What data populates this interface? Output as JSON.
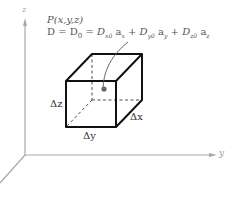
{
  "diagram": {
    "axes": {
      "z_label": "z",
      "y_label": "y",
      "x_label": ""
    },
    "point_label": "P(x,y,z)",
    "equation": {
      "lhs": "D",
      "eq1": "=",
      "d0": "D",
      "d0_sub": "0",
      "eq2": "=",
      "terms": [
        {
          "coef": "D",
          "coef_sub": "x0",
          "unit": "a",
          "unit_sub": "x"
        },
        {
          "coef": "D",
          "coef_sub": "y0",
          "unit": "a",
          "unit_sub": "y"
        },
        {
          "coef": "D",
          "coef_sub": "z0",
          "unit": "a",
          "unit_sub": "z"
        }
      ],
      "plus": "+"
    },
    "cube_labels": {
      "dz": "Δz",
      "dy": "Δy",
      "dx": "Δx"
    },
    "colors": {
      "cube_edge": "#111111",
      "axis": "#9a9a9a",
      "text": "#555555",
      "point": "#555555"
    }
  }
}
